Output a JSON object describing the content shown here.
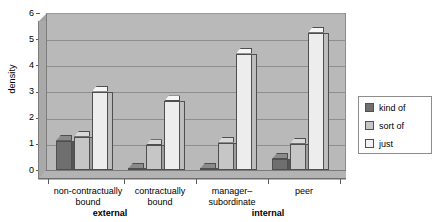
{
  "chart_data": {
    "type": "bar",
    "title": "",
    "subtitle": "",
    "xlabel": "",
    "ylabel": "density",
    "ylim": [
      0,
      6
    ],
    "yticks": [
      0,
      1,
      2,
      3,
      4,
      5,
      6
    ],
    "grid": true,
    "legend_position": "right",
    "style": "3d-grouped-column",
    "categories": [
      "non-contractually bound",
      "contractually bound",
      "manager–subordinate",
      "peer"
    ],
    "category_lines": [
      [
        "non-contractually",
        "bound"
      ],
      [
        "contractually",
        "bound"
      ],
      [
        "manager–",
        "subordinate"
      ],
      [
        "peer",
        ""
      ]
    ],
    "supergroups": [
      {
        "label": "external",
        "categories": [
          "non-contractually bound",
          "contractually bound"
        ]
      },
      {
        "label": "internal",
        "categories": [
          "manager–subordinate",
          "peer"
        ]
      }
    ],
    "series": [
      {
        "name": "kind of",
        "color": "#6f6f6f",
        "values": [
          1.12,
          0.05,
          0.05,
          0.42
        ]
      },
      {
        "name": "sort of",
        "color": "#c6c6c6",
        "values": [
          1.27,
          0.95,
          1.05,
          1.0
        ]
      },
      {
        "name": "just",
        "color": "#ededed",
        "values": [
          3.0,
          2.62,
          4.45,
          5.25
        ]
      }
    ]
  },
  "legend": {
    "items": [
      {
        "label": "kind of"
      },
      {
        "label": "sort of"
      },
      {
        "label": "just"
      }
    ]
  },
  "colors": {
    "plot_background": "#b9b9b9",
    "gridline": "#8e8e8e",
    "axis": "#5a5a5a",
    "page_background": "#ffffff"
  }
}
